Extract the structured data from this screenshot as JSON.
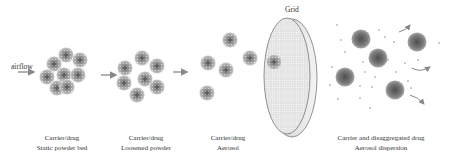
{
  "diagram": {
    "airflow_label": "airflow",
    "grid_label": "Grid",
    "stages": [
      {
        "line1": "Carrier/drug",
        "line2": "Static powder bed"
      },
      {
        "line1": "Carrier/drug",
        "line2": "Loosened powder"
      },
      {
        "line1": "Carrier/drug",
        "line2": "Aerosol"
      },
      {
        "line1": "Carrier and disaggregated drug",
        "line2": "Aerosol dispersion"
      }
    ],
    "colors": {
      "cluster": "#8a8a8a",
      "carrier": "#6f6f6f",
      "grid_fill": "#eeeeee",
      "arrow": "#888888"
    }
  }
}
